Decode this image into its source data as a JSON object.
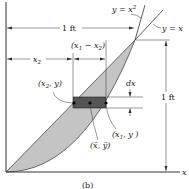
{
  "figure": {
    "caption": "(b)",
    "curves": {
      "parabola_label": "y = x",
      "parabola_exp": "2",
      "line_label": "y = x"
    },
    "dimensions": {
      "width_label": "1 ft",
      "height_label": "1 ft",
      "x2_label": "x",
      "x2_sub": "2",
      "diff_label_open": "(x",
      "diff_sub1": "1",
      "diff_mid": " − x",
      "diff_sub2": "2",
      "diff_close": ")",
      "dx_label": "dx"
    },
    "points": {
      "left_open": "(x",
      "left_sub": "2",
      "left_close": ", y)",
      "right_open": "(x",
      "right_sub": "1",
      "right_close": ", y )",
      "centroid": "(x̄, ȳ)"
    },
    "axes": {
      "x_label": "x"
    },
    "colors": {
      "region_fill": "#c4c4c4",
      "strip_fill": "#555555",
      "line": "#333333"
    }
  }
}
